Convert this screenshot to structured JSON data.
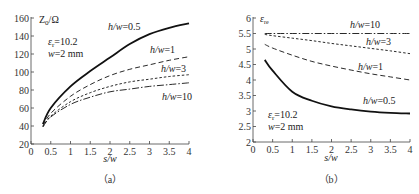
{
  "chart_data": [
    {
      "panel": "a",
      "type": "line",
      "caption": "（a）",
      "xlabel": "s/w",
      "ylabel": "Z0/Ω",
      "xlim": [
        0,
        4
      ],
      "ylim": [
        20,
        160
      ],
      "xticks": [
        "0",
        "0.5",
        "1",
        "1.5",
        "2",
        "2.5",
        "3",
        "3.5",
        "4"
      ],
      "yticks": [
        "20",
        "40",
        "60",
        "80",
        "100",
        "120",
        "140",
        "160"
      ],
      "annotation": [
        "εr=10.2",
        "w=2 mm"
      ],
      "x": [
        0.3,
        0.5,
        1.0,
        1.5,
        2.0,
        2.5,
        3.0,
        3.5,
        4.0
      ],
      "series": [
        {
          "name": "h/w=0.5",
          "style": "solid-bold",
          "values": [
            42,
            60,
            84,
            101,
            116,
            131,
            142,
            149,
            154
          ]
        },
        {
          "name": "h/w=1",
          "style": "dashed",
          "values": [
            40,
            54,
            73,
            86,
            96,
            103,
            108,
            113,
            117
          ]
        },
        {
          "name": "h/w=3",
          "style": "short-dashed",
          "values": [
            39,
            51,
            67,
            77,
            84,
            89,
            92,
            95,
            97
          ]
        },
        {
          "name": "h/w=10",
          "style": "dash-dot",
          "values": [
            39,
            50,
            64,
            72,
            78,
            81,
            84,
            86,
            88
          ]
        }
      ],
      "grid": false,
      "legend": "inline labels"
    },
    {
      "panel": "b",
      "type": "line",
      "caption": "（b）",
      "xlabel": "s/w",
      "ylabel": "εre",
      "xlim": [
        0,
        4
      ],
      "ylim": [
        2,
        6
      ],
      "xticks": [
        "0",
        "0.5",
        "1",
        "1.5",
        "2",
        "2.5",
        "3",
        "3.5",
        "4"
      ],
      "yticks": [
        "2",
        "2.5",
        "3",
        "3.5",
        "4",
        "4.5",
        "5",
        "5.5",
        "6"
      ],
      "annotation": [
        "εr=10.2",
        "w=2 mm"
      ],
      "x": [
        0.3,
        0.5,
        1.0,
        1.5,
        2.0,
        2.5,
        3.0,
        3.5,
        4.0
      ],
      "series": [
        {
          "name": "h/w=10",
          "style": "dash-dot",
          "values": [
            5.5,
            5.5,
            5.5,
            5.5,
            5.5,
            5.5,
            5.5,
            5.5,
            5.5
          ]
        },
        {
          "name": "h/w=3",
          "style": "short-dashed",
          "values": [
            5.47,
            5.43,
            5.35,
            5.27,
            5.18,
            5.1,
            5.02,
            4.94,
            4.85
          ]
        },
        {
          "name": "h/w=1",
          "style": "dashed",
          "values": [
            5.15,
            5.03,
            4.8,
            4.6,
            4.45,
            4.32,
            4.2,
            4.1,
            4.0
          ]
        },
        {
          "name": "h/w=0.5",
          "style": "solid-bold",
          "values": [
            4.65,
            4.3,
            3.62,
            3.33,
            3.15,
            3.05,
            2.98,
            2.94,
            2.92
          ]
        }
      ],
      "grid": false,
      "legend": "inline labels"
    }
  ],
  "labels": {
    "a": {
      "ylabel_main": "Z",
      "ylabel_sub": "0",
      "ylabel_unit": "/Ω",
      "eps": "ε",
      "eps_sub": "r",
      "eps_val": "=10.2",
      "w_var": "w",
      "w_val": "=2 mm",
      "xlabel": "s/w",
      "caption": "（a）",
      "curve_labels": [
        "h/w",
        "=0.5",
        "h/w",
        "=1",
        "h/w",
        "=3",
        "h/w",
        "=10"
      ]
    },
    "b": {
      "ylabel_main": "ε",
      "ylabel_sub": "re",
      "eps": "ε",
      "eps_sub": "r",
      "eps_val": "=10.2",
      "w_var": "w",
      "w_val": "=2 mm",
      "xlabel": "s/w",
      "caption": "（b）",
      "curve_labels": [
        "h/w",
        "=10",
        "h/w",
        "=3",
        "h/w",
        "=1",
        "h/w",
        "=0.5"
      ]
    }
  }
}
